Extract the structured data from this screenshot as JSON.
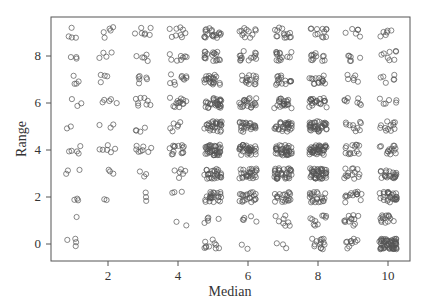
{
  "chart_data": {
    "type": "scatter",
    "title": "",
    "xlabel": "Median",
    "ylabel": "Range",
    "xlim": [
      0.5,
      10.7
    ],
    "ylim": [
      -0.4,
      9.3
    ],
    "xticks": [
      2,
      4,
      6,
      8,
      10
    ],
    "yticks": [
      0,
      2,
      4,
      6,
      8
    ],
    "grid": false,
    "legend": null,
    "marker": "open-circle",
    "jitter": 0.25,
    "cells": [
      {
        "x": 1,
        "y": 0,
        "n": 4
      },
      {
        "x": 1,
        "y": 1,
        "n": 1
      },
      {
        "x": 1,
        "y": 2,
        "n": 3
      },
      {
        "x": 1,
        "y": 3,
        "n": 3
      },
      {
        "x": 1,
        "y": 4,
        "n": 5
      },
      {
        "x": 1,
        "y": 5,
        "n": 2
      },
      {
        "x": 1,
        "y": 6,
        "n": 3
      },
      {
        "x": 1,
        "y": 7,
        "n": 4
      },
      {
        "x": 1,
        "y": 8,
        "n": 3
      },
      {
        "x": 1,
        "y": 9,
        "n": 4
      },
      {
        "x": 2,
        "y": 2,
        "n": 2
      },
      {
        "x": 2,
        "y": 3,
        "n": 3
      },
      {
        "x": 2,
        "y": 4,
        "n": 6
      },
      {
        "x": 2,
        "y": 5,
        "n": 3
      },
      {
        "x": 2,
        "y": 6,
        "n": 5
      },
      {
        "x": 2,
        "y": 7,
        "n": 4
      },
      {
        "x": 2,
        "y": 8,
        "n": 4
      },
      {
        "x": 2,
        "y": 9,
        "n": 5
      },
      {
        "x": 3,
        "y": 2,
        "n": 3
      },
      {
        "x": 3,
        "y": 3,
        "n": 3
      },
      {
        "x": 3,
        "y": 4,
        "n": 8
      },
      {
        "x": 3,
        "y": 5,
        "n": 4
      },
      {
        "x": 3,
        "y": 6,
        "n": 8
      },
      {
        "x": 3,
        "y": 7,
        "n": 6
      },
      {
        "x": 3,
        "y": 8,
        "n": 5
      },
      {
        "x": 3,
        "y": 9,
        "n": 7
      },
      {
        "x": 4,
        "y": 1,
        "n": 2
      },
      {
        "x": 4,
        "y": 2,
        "n": 3
      },
      {
        "x": 4,
        "y": 3,
        "n": 6
      },
      {
        "x": 4,
        "y": 4,
        "n": 14
      },
      {
        "x": 4,
        "y": 5,
        "n": 6
      },
      {
        "x": 4,
        "y": 6,
        "n": 14
      },
      {
        "x": 4,
        "y": 7,
        "n": 10
      },
      {
        "x": 4,
        "y": 8,
        "n": 8
      },
      {
        "x": 4,
        "y": 9,
        "n": 9
      },
      {
        "x": 5,
        "y": 0,
        "n": 10
      },
      {
        "x": 5,
        "y": 1,
        "n": 5
      },
      {
        "x": 5,
        "y": 2,
        "n": 25
      },
      {
        "x": 5,
        "y": 3,
        "n": 28
      },
      {
        "x": 5,
        "y": 4,
        "n": 40
      },
      {
        "x": 5,
        "y": 5,
        "n": 30
      },
      {
        "x": 5,
        "y": 6,
        "n": 30
      },
      {
        "x": 5,
        "y": 7,
        "n": 22
      },
      {
        "x": 5,
        "y": 8,
        "n": 18
      },
      {
        "x": 5,
        "y": 9,
        "n": 20
      },
      {
        "x": 6,
        "y": 0,
        "n": 2
      },
      {
        "x": 6,
        "y": 1,
        "n": 5
      },
      {
        "x": 6,
        "y": 2,
        "n": 22
      },
      {
        "x": 6,
        "y": 3,
        "n": 28
      },
      {
        "x": 6,
        "y": 4,
        "n": 35
      },
      {
        "x": 6,
        "y": 5,
        "n": 25
      },
      {
        "x": 6,
        "y": 6,
        "n": 22
      },
      {
        "x": 6,
        "y": 7,
        "n": 16
      },
      {
        "x": 6,
        "y": 8,
        "n": 14
      },
      {
        "x": 6,
        "y": 9,
        "n": 12
      },
      {
        "x": 7,
        "y": 0,
        "n": 3
      },
      {
        "x": 7,
        "y": 1,
        "n": 8
      },
      {
        "x": 7,
        "y": 2,
        "n": 20
      },
      {
        "x": 7,
        "y": 3,
        "n": 35
      },
      {
        "x": 7,
        "y": 4,
        "n": 40
      },
      {
        "x": 7,
        "y": 5,
        "n": 30
      },
      {
        "x": 7,
        "y": 6,
        "n": 22
      },
      {
        "x": 7,
        "y": 7,
        "n": 16
      },
      {
        "x": 7,
        "y": 8,
        "n": 14
      },
      {
        "x": 7,
        "y": 9,
        "n": 14
      },
      {
        "x": 8,
        "y": 0,
        "n": 14
      },
      {
        "x": 8,
        "y": 1,
        "n": 10
      },
      {
        "x": 8,
        "y": 2,
        "n": 22
      },
      {
        "x": 8,
        "y": 3,
        "n": 45
      },
      {
        "x": 8,
        "y": 4,
        "n": 45
      },
      {
        "x": 8,
        "y": 5,
        "n": 38
      },
      {
        "x": 8,
        "y": 6,
        "n": 22
      },
      {
        "x": 8,
        "y": 7,
        "n": 16
      },
      {
        "x": 8,
        "y": 8,
        "n": 12
      },
      {
        "x": 8,
        "y": 9,
        "n": 12
      },
      {
        "x": 9,
        "y": 0,
        "n": 10
      },
      {
        "x": 9,
        "y": 1,
        "n": 12
      },
      {
        "x": 9,
        "y": 2,
        "n": 14
      },
      {
        "x": 9,
        "y": 3,
        "n": 14
      },
      {
        "x": 9,
        "y": 4,
        "n": 14
      },
      {
        "x": 9,
        "y": 5,
        "n": 10
      },
      {
        "x": 9,
        "y": 6,
        "n": 8
      },
      {
        "x": 9,
        "y": 7,
        "n": 6
      },
      {
        "x": 9,
        "y": 8,
        "n": 6
      },
      {
        "x": 9,
        "y": 9,
        "n": 6
      },
      {
        "x": 10,
        "y": 0,
        "n": 60
      },
      {
        "x": 10,
        "y": 1,
        "n": 14
      },
      {
        "x": 10,
        "y": 2,
        "n": 28
      },
      {
        "x": 10,
        "y": 3,
        "n": 22
      },
      {
        "x": 10,
        "y": 4,
        "n": 14
      },
      {
        "x": 10,
        "y": 5,
        "n": 12
      },
      {
        "x": 10,
        "y": 6,
        "n": 6
      },
      {
        "x": 10,
        "y": 7,
        "n": 6
      },
      {
        "x": 10,
        "y": 8,
        "n": 8
      },
      {
        "x": 10,
        "y": 9,
        "n": 6
      }
    ]
  },
  "colors": {
    "marker": "#555555",
    "axis": "#555555",
    "background": "#ffffff"
  }
}
